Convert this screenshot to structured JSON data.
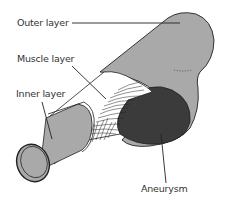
{
  "diagram": {
    "labels": {
      "outer": "Outer layer",
      "muscle": "Muscle layer",
      "inner": "Inner layer",
      "aneurysm": "Aneurysm"
    },
    "colors": {
      "outer_layer": "#a9a9a9",
      "inner_layer": "#a9a9a9",
      "muscle_layer": "#ffffff",
      "aneurysm": "#3b3b3b",
      "outline": "#222222",
      "text": "#333333"
    }
  }
}
